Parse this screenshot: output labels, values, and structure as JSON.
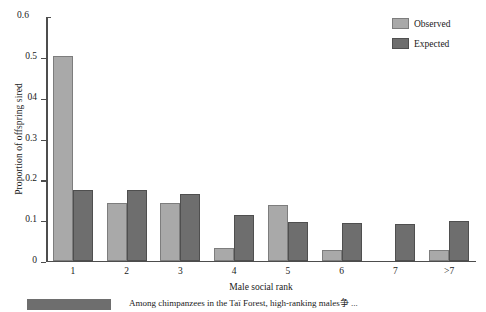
{
  "chart_data": {
    "type": "bar",
    "title": "",
    "subtitle": "",
    "xlabel": "Male social rank",
    "ylabel": "Proportion of offspring sired",
    "categories": [
      "1",
      "2",
      "3",
      "4",
      "5",
      "6",
      "7",
      ">7"
    ],
    "series": [
      {
        "name": "Observed",
        "color": "#a9a9a9",
        "values": [
          0.503,
          0.142,
          0.142,
          0.031,
          0.138,
          0.027,
          0.0,
          0.026
        ]
      },
      {
        "name": "Expected",
        "color": "#6e6e6e",
        "values": [
          0.173,
          0.173,
          0.163,
          0.112,
          0.095,
          0.094,
          0.091,
          0.098
        ]
      }
    ],
    "ylim": [
      0,
      0.6
    ],
    "ytick_values": [
      0,
      0.1,
      0.2,
      0.3,
      0.4,
      0.5,
      0.6
    ],
    "ytick_labels": [
      "0",
      "0.1",
      "0.2",
      "0.3",
      "04",
      "0.5",
      "0.6"
    ],
    "grid": false,
    "legend_position": "top-right"
  },
  "legend": {
    "entries": [
      {
        "label": "Observed",
        "swatch": "observed"
      },
      {
        "label": "Expected",
        "swatch": "expected"
      }
    ]
  },
  "caption": {
    "text": "Among chimpanzees in the Taï Forest, high-ranking males争 ..."
  }
}
